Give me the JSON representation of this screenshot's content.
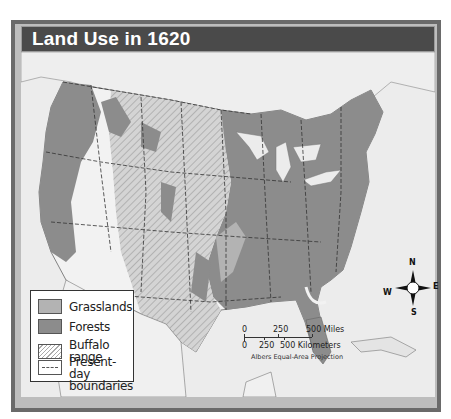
{
  "map": {
    "title": "Land Use in 1620",
    "legend": {
      "items": [
        {
          "label": "Grasslands",
          "swatch": "grasslands",
          "color": "#b3b3b3"
        },
        {
          "label": "Forests",
          "swatch": "forests",
          "color": "#8c8c8c"
        },
        {
          "label": "Buffalo range",
          "swatch": "hatched"
        },
        {
          "label": "Present-day",
          "label2": "boundaries",
          "swatch": "dashed"
        }
      ]
    },
    "scale": {
      "miles_ticks": [
        "0",
        "250",
        "500 Miles"
      ],
      "km_ticks": [
        "0",
        "250",
        "500 Kilometers"
      ],
      "projection": "Albers Equal-Area Projection"
    },
    "compass": {
      "n": "N",
      "e": "E",
      "s": "S",
      "w": "W"
    },
    "colors": {
      "frame": "#6a6a6a",
      "title_bar": "#4a4a4a",
      "water": "#ececec",
      "forest": "#8c8c8c",
      "grassland": "#b3b3b3",
      "other_land": "#f2f2f2"
    }
  }
}
